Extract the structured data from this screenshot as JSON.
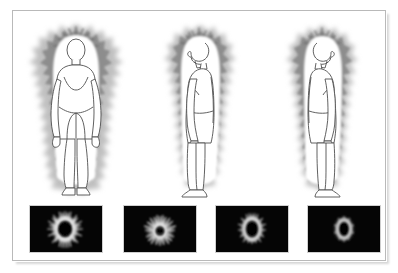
{
  "figure": {
    "title": "Human aura fields and Kirlian fingertip coronas",
    "background_color": "#ffffff",
    "frame_border_color": "#b9b9b9"
  },
  "aura_panels": {
    "caption": "Whole-body aura emanation drawings",
    "items": [
      {
        "id": "aura-fig-1",
        "label": "Front view figure with aura",
        "view": "front",
        "aura_shape": "broad spiky halo",
        "aura_color_outer": "#b4b4b4",
        "aura_color_inner": "#6e6e6e",
        "body_outline_color": "#555555",
        "body_fill_color": "#ffffff"
      },
      {
        "id": "aura-fig-2",
        "label": "Side profile figure with aura, facing left",
        "view": "profile-left",
        "aura_shape": "narrow spiky halo",
        "aura_color_outer": "#b4b4b4",
        "aura_color_inner": "#6e6e6e",
        "body_outline_color": "#555555",
        "body_fill_color": "#ffffff"
      },
      {
        "id": "aura-fig-3",
        "label": "Side profile figure with aura, facing right",
        "view": "profile-right",
        "aura_shape": "narrow spiky halo",
        "aura_color_outer": "#b4b4b4",
        "aura_color_inner": "#6e6e6e",
        "body_outline_color": "#555555",
        "body_fill_color": "#ffffff"
      }
    ]
  },
  "kirlian_panels": {
    "caption": "Kirlian corona discharge photographs",
    "panel_background_color": "#050505",
    "corona_color": "#f2f2f2",
    "items": [
      {
        "id": "kirlian-panel-1",
        "label": "Corona with dense long rays",
        "ray_count": 26,
        "ray_length": "long",
        "corona_size": "large",
        "brightness": "high"
      },
      {
        "id": "kirlian-panel-2",
        "label": "Small corona with scattered bright rays",
        "ray_count": 22,
        "ray_length": "long",
        "corona_size": "small",
        "brightness": "high"
      },
      {
        "id": "kirlian-panel-3",
        "label": "Oval corona with short rays",
        "ray_count": 18,
        "ray_length": "short",
        "corona_size": "large",
        "brightness": "medium"
      },
      {
        "id": "kirlian-panel-4",
        "label": "Smooth oval corona with minimal rays",
        "ray_count": 10,
        "ray_length": "very short",
        "corona_size": "medium",
        "brightness": "medium"
      }
    ]
  }
}
